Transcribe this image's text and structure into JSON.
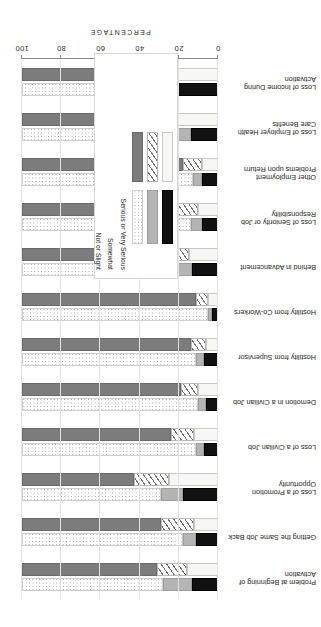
{
  "chart_data": {
    "type": "bar",
    "title": "",
    "xlabel": "PERCENTAGE",
    "ylabel": "",
    "xlim": [
      0,
      100
    ],
    "xticks": [
      0,
      20,
      40,
      60,
      80,
      100
    ],
    "grid": true,
    "orientation": "horizontal-stacked",
    "page_rotation_degrees": 180,
    "legend": {
      "position": "inside-lower-right",
      "group_titles": [
        "ANTICIPATED",
        "ACTUAL"
      ],
      "row_labels": [
        "Serious or Very Serious",
        "Somewhat",
        "Not or Slight"
      ]
    },
    "segment_names": [
      "Serious or Very Serious",
      "Somewhat",
      "Not or Slight"
    ],
    "categories": [
      "Problem at Beginning of Activation",
      "Getting the Same Job Back",
      "Loss of a Promotion Opportunity",
      "Loss of a Civilian Job",
      "Demotion in a Civilian Job",
      "Hostility from Supervisor",
      "Hostility from Co-Workers",
      "Behind in Advancement",
      "Loss of Seniority or Job Responsibility",
      "Other Employment Problems upon Return",
      "Loss of Employer Health Care Benefits",
      "Loss of Income During Activation"
    ],
    "series": [
      {
        "name": "ANTICIPATED",
        "stacks": [
          {
            "category": "Problem at Beginning of Activation",
            "Serious or Very Serious": 16,
            "Somewhat": 15,
            "Not or Slight": 69
          },
          {
            "category": "Getting the Same Job Back",
            "Serious or Very Serious": 12,
            "Somewhat": 17,
            "Not or Slight": 71
          },
          {
            "category": "Loss of a Promotion Opportunity",
            "Serious or Very Serious": 25,
            "Somewhat": 18,
            "Not or Slight": 57
          },
          {
            "category": "Loss of a Civilian Job",
            "Serious or Very Serious": 12,
            "Somewhat": 12,
            "Not or Slight": 76
          },
          {
            "category": "Demotion in a Civilian Job",
            "Serious or Very Serious": 10,
            "Somewhat": 9,
            "Not or Slight": 81
          },
          {
            "category": "Hostility from Supervisor",
            "Serious or Very Serious": 6,
            "Somewhat": 8,
            "Not or Slight": 86
          },
          {
            "category": "Hostility from Co-Workers",
            "Serious or Very Serious": 5,
            "Somewhat": 6,
            "Not or Slight": 89
          },
          {
            "category": "Behind in Advancement",
            "Serious or Very Serious": 15,
            "Somewhat": 16,
            "Not or Slight": 69
          },
          {
            "category": "Loss of Seniority or Job Responsibility",
            "Serious or Very Serious": 10,
            "Somewhat": 12,
            "Not or Slight": 78
          },
          {
            "category": "Other Employment Problems upon Return",
            "Serious or Very Serious": 8,
            "Somewhat": 10,
            "Not or Slight": 82
          },
          {
            "category": "Loss of Employer Health Care Benefits",
            "Serious or Very Serious": 22,
            "Somewhat": 18,
            "Not or Slight": 60
          },
          {
            "category": "Loss of Income During Activation",
            "Serious or Very Serious": 37,
            "Somewhat": 24,
            "Not or Slight": 39
          }
        ]
      },
      {
        "name": "ACTUAL",
        "stacks": [
          {
            "category": "Problem at Beginning of Activation",
            "Serious or Very Serious": 13,
            "Somewhat": 15,
            "Not or Slight": 72
          },
          {
            "category": "Getting the Same Job Back",
            "Serious or Very Serious": 11,
            "Somewhat": 7,
            "Not or Slight": 82
          },
          {
            "category": "Loss of a Promotion Opportunity",
            "Serious or Very Serious": 18,
            "Somewhat": 11,
            "Not or Slight": 71
          },
          {
            "category": "Loss of a Civilian Job",
            "Serious or Very Serious": 7,
            "Somewhat": 4,
            "Not or Slight": 89
          },
          {
            "category": "Demotion in a Civilian Job",
            "Serious or Very Serious": 6,
            "Somewhat": 4,
            "Not or Slight": 90
          },
          {
            "category": "Hostility from Supervisor",
            "Serious or Very Serious": 7,
            "Somewhat": 4,
            "Not or Slight": 89
          },
          {
            "category": "Hostility from Co-Workers",
            "Serious or Very Serious": 3,
            "Somewhat": 2,
            "Not or Slight": 95
          },
          {
            "category": "Behind in Advancement",
            "Serious or Very Serious": 13,
            "Somewhat": 9,
            "Not or Slight": 78
          },
          {
            "category": "Loss of Seniority or Job Responsibility",
            "Serious or Very Serious": 8,
            "Somewhat": 6,
            "Not or Slight": 86
          },
          {
            "category": "Other Employment Problems upon Return",
            "Serious or Very Serious": 8,
            "Somewhat": 5,
            "Not or Slight": 87
          },
          {
            "category": "Loss of Employer Health Care Benefits",
            "Serious or Very Serious": 14,
            "Somewhat": 8,
            "Not or Slight": 78
          },
          {
            "category": "Loss of Income During Activation",
            "Serious or Very Serious": 23,
            "Somewhat": 16,
            "Not or Slight": 61
          }
        ]
      }
    ]
  }
}
